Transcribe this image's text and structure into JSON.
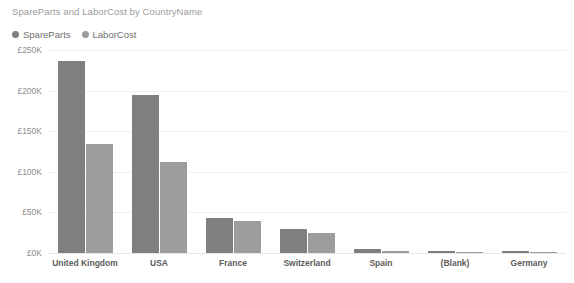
{
  "chart_data": {
    "type": "bar",
    "title": "SpareParts and LaborCost by CountryName",
    "xlabel": "",
    "ylabel": "",
    "ylim": [
      0,
      250
    ],
    "y_unit": "£K",
    "grid": true,
    "legend_position": "top-left",
    "categories": [
      "United Kingdom",
      "USA",
      "France",
      "Switzerland",
      "Spain",
      "(Blank)",
      "Germany"
    ],
    "y_ticks": [
      "£0K",
      "£50K",
      "£100K",
      "£150K",
      "£200K",
      "£250K"
    ],
    "y_tick_values": [
      0,
      50,
      100,
      150,
      200,
      250
    ],
    "series": [
      {
        "name": "SpareParts",
        "color": "#7f7f7f",
        "values": [
          237,
          195,
          43,
          29,
          5,
          3,
          2
        ]
      },
      {
        "name": "LaborCost",
        "color": "#9d9d9d",
        "values": [
          134,
          112,
          39,
          25,
          2,
          1,
          1
        ]
      }
    ]
  },
  "legend": {
    "items": [
      {
        "label": "SpareParts",
        "color": "#7f7f7f"
      },
      {
        "label": "LaborCost",
        "color": "#9d9d9d"
      }
    ]
  },
  "colors": {
    "spare_parts": "#7f7f7f",
    "labor_cost": "#9d9d9d",
    "gridline": "#f0f0f0",
    "baseline": "#e6e6e6",
    "title_text": "#9b9b9b",
    "axis_text": "#8d8d8d",
    "category_text": "#5c5c5c",
    "background": "#ffffff"
  }
}
